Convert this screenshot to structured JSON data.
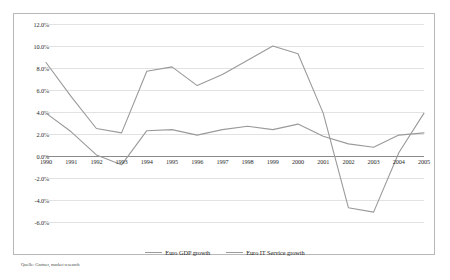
{
  "chart_data": {
    "type": "line",
    "title": "",
    "xlabel": "",
    "ylabel": "",
    "x": [
      1990,
      1991,
      1992,
      1993,
      1994,
      1995,
      1996,
      1997,
      1998,
      1999,
      2000,
      2001,
      2002,
      2003,
      2004,
      2005
    ],
    "categories": [
      "1990",
      "1991",
      "1992",
      "1993",
      "1994",
      "1995",
      "1996",
      "1997",
      "1998",
      "1999",
      "2000",
      "2001",
      "2002",
      "2003",
      "2004",
      "2005"
    ],
    "ylim": [
      -6,
      12
    ],
    "ytick_step": 2,
    "yticks": [
      12,
      10,
      8,
      6,
      4,
      2,
      0,
      -2,
      -4,
      -6
    ],
    "ytick_labels": [
      "12.0%",
      "10.0%",
      "8.0%",
      "6.0%",
      "4.0%",
      "2.0%",
      "0.0%",
      "-2.0%",
      "-4.0%",
      "-6.0%"
    ],
    "grid": true,
    "zero_line": true,
    "legend_position": "bottom",
    "series": [
      {
        "name": "Euro GDP growth",
        "color": "#9a9a9a",
        "values": [
          3.9,
          2.2,
          0.1,
          -0.8,
          2.3,
          2.4,
          1.9,
          2.4,
          2.7,
          2.4,
          2.9,
          1.8,
          1.1,
          0.8,
          1.9,
          2.1
        ]
      },
      {
        "name": "Euro IT Service growth",
        "color": "#9a9a9a",
        "values": [
          8.5,
          5.4,
          2.5,
          2.1,
          7.7,
          8.1,
          6.4,
          7.4,
          8.7,
          10.0,
          9.3,
          3.9,
          -4.7,
          -5.1,
          0.3,
          3.9
        ]
      }
    ]
  },
  "legend": {
    "items": [
      {
        "label": "Euro GDP growth"
      },
      {
        "label": "Euro IT Service growth"
      }
    ]
  },
  "source": {
    "text": "Quelle: Gartner, market research"
  },
  "colors": {
    "line": "#9a9a9a",
    "grid": "#e2e2e2",
    "zero_line": "#8a8a8a",
    "frame": "#b8b8b8",
    "text": "#2b2b2b"
  }
}
